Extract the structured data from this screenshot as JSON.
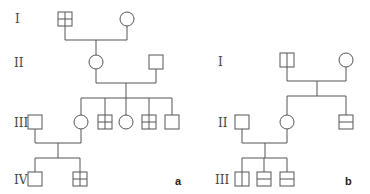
{
  "panels": [
    {
      "id": "a",
      "label": "a",
      "generations": [
        "I",
        "II",
        "III",
        "IV"
      ],
      "individuals": [
        {
          "id": "a-I-1",
          "gen": "I",
          "sex": "male",
          "marking": "cross"
        },
        {
          "id": "a-I-2",
          "gen": "I",
          "sex": "female",
          "marking": "none"
        },
        {
          "id": "a-II-1",
          "gen": "II",
          "sex": "female",
          "marking": "none"
        },
        {
          "id": "a-II-2",
          "gen": "II",
          "sex": "male",
          "marking": "none"
        },
        {
          "id": "a-III-1",
          "gen": "III",
          "sex": "male",
          "marking": "none"
        },
        {
          "id": "a-III-2",
          "gen": "III",
          "sex": "female",
          "marking": "none"
        },
        {
          "id": "a-III-3",
          "gen": "III",
          "sex": "male",
          "marking": "cross"
        },
        {
          "id": "a-III-4",
          "gen": "III",
          "sex": "female",
          "marking": "none"
        },
        {
          "id": "a-III-5",
          "gen": "III",
          "sex": "male",
          "marking": "cross"
        },
        {
          "id": "a-III-6",
          "gen": "III",
          "sex": "male",
          "marking": "none"
        },
        {
          "id": "a-IV-1",
          "gen": "IV",
          "sex": "male",
          "marking": "none"
        },
        {
          "id": "a-IV-2",
          "gen": "IV",
          "sex": "male",
          "marking": "cross"
        }
      ],
      "unions": [
        {
          "partners": [
            "a-I-1",
            "a-I-2"
          ],
          "children": [
            "a-II-1"
          ]
        },
        {
          "partners": [
            "a-II-1",
            "a-II-2"
          ],
          "children": [
            "a-III-2",
            "a-III-3",
            "a-III-4",
            "a-III-5",
            "a-III-6"
          ]
        },
        {
          "partners": [
            "a-III-1",
            "a-III-2"
          ],
          "children": [
            "a-IV-1",
            "a-IV-2"
          ]
        }
      ]
    },
    {
      "id": "b",
      "label": "b",
      "generations": [
        "I",
        "II",
        "III"
      ],
      "individuals": [
        {
          "id": "b-I-1",
          "gen": "I",
          "sex": "male",
          "marking": "vertical"
        },
        {
          "id": "b-I-2",
          "gen": "I",
          "sex": "female",
          "marking": "none"
        },
        {
          "id": "b-II-1",
          "gen": "II",
          "sex": "male",
          "marking": "none"
        },
        {
          "id": "b-II-2",
          "gen": "II",
          "sex": "female",
          "marking": "none"
        },
        {
          "id": "b-II-3",
          "gen": "II",
          "sex": "male",
          "marking": "horizontal"
        },
        {
          "id": "b-III-1",
          "gen": "III",
          "sex": "male",
          "marking": "vertical"
        },
        {
          "id": "b-III-2",
          "gen": "III",
          "sex": "male",
          "marking": "horizontal"
        },
        {
          "id": "b-III-3",
          "gen": "III",
          "sex": "male",
          "marking": "horizontal"
        }
      ],
      "unions": [
        {
          "partners": [
            "b-I-1",
            "b-I-2"
          ],
          "children": [
            "b-II-2",
            "b-II-3"
          ]
        },
        {
          "partners": [
            "b-II-1",
            "b-II-2"
          ],
          "children": [
            "b-III-1",
            "b-III-2",
            "b-III-3"
          ]
        }
      ]
    }
  ]
}
